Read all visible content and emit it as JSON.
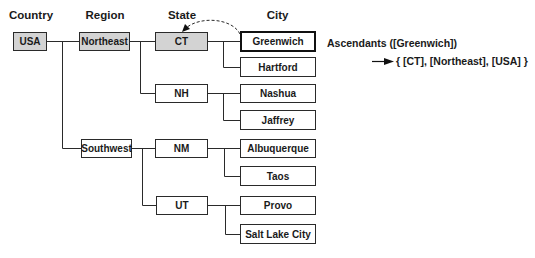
{
  "headers": {
    "country": "Country",
    "region": "Region",
    "state": "State",
    "city": "City"
  },
  "nodes": {
    "usa": "USA",
    "northeast": "Northeast",
    "southwest": "Southwest",
    "ct": "CT",
    "nh": "NH",
    "nm": "NM",
    "ut": "UT",
    "greenwich": "Greenwich",
    "hartford": "Hartford",
    "nashua": "Nashua",
    "jaffrey": "Jaffrey",
    "albuquerque": "Albuquerque",
    "taos": "Taos",
    "provo": "Provo",
    "salt_lake_city": "Salt Lake City"
  },
  "annotation": {
    "function_call": "Ascendants ([Greenwich])",
    "result": "{ [CT], [Northeast], [USA] }"
  },
  "colors": {
    "shaded_fill": "#d3d3d3",
    "line": "#2a2a2a"
  }
}
